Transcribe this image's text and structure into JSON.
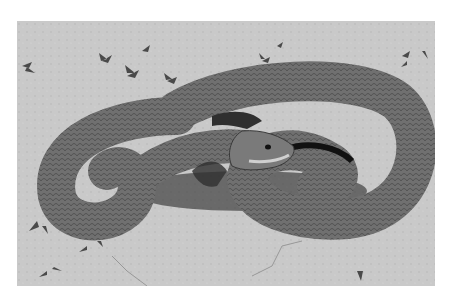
{
  "image": {
    "subject": "snake",
    "description": "Grayscale photograph of a coiled snake resting on sandy ground with small sprouting plants",
    "colors": {
      "background": "#ffffff",
      "ground": "#c8c8c8",
      "snake_body": "#6e6e6e",
      "snake_dark": "#3a3a3a",
      "shadow": "#1a1a1a"
    }
  }
}
